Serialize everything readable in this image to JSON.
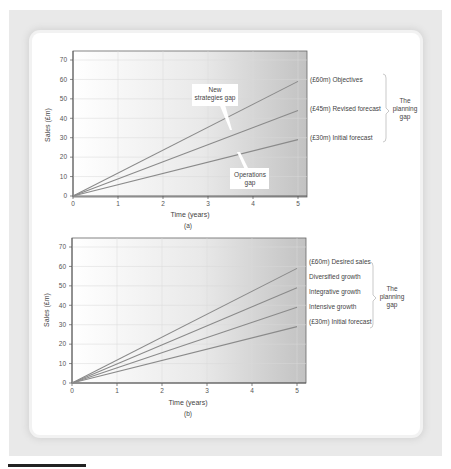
{
  "chart_data": [
    {
      "id": "a",
      "type": "line",
      "caption": "(a)",
      "xlabel": "Time (years)",
      "ylabel": "Sales (£m)",
      "xlim": [
        0,
        5
      ],
      "ylim": [
        0,
        70
      ],
      "xticks": [
        "0",
        "1",
        "2",
        "3",
        "4",
        "5"
      ],
      "yticks": [
        "0",
        "10",
        "20",
        "30",
        "40",
        "50",
        "60",
        "70"
      ],
      "grid": true,
      "series": [
        {
          "name": "(£60m) Objectives",
          "x": [
            0,
            5
          ],
          "y": [
            0,
            59
          ]
        },
        {
          "name": "(£45m) Revised forecast",
          "x": [
            0,
            5
          ],
          "y": [
            0,
            44
          ]
        },
        {
          "name": "(£30m) Initial forecast",
          "x": [
            0,
            5
          ],
          "y": [
            0,
            29
          ]
        }
      ],
      "annotations": [
        {
          "text": [
            "New",
            "strategies gap"
          ],
          "points_to": "between Objectives and Revised forecast"
        },
        {
          "text": [
            "Operations",
            "gap"
          ],
          "points_to": "between Revised forecast and Initial forecast"
        }
      ],
      "bracket_label": [
        "The",
        "planning",
        "gap"
      ]
    },
    {
      "id": "b",
      "type": "line",
      "caption": "(b)",
      "xlabel": "Time (years)",
      "ylabel": "Sales (£m)",
      "xlim": [
        0,
        5
      ],
      "ylim": [
        0,
        70
      ],
      "xticks": [
        "0",
        "1",
        "2",
        "3",
        "4",
        "5"
      ],
      "yticks": [
        "0",
        "10",
        "20",
        "30",
        "40",
        "50",
        "60",
        "70"
      ],
      "grid": true,
      "series": [
        {
          "name": "(£60m) Desired sales",
          "x": [
            0,
            5
          ],
          "y": [
            0,
            59
          ]
        },
        {
          "name": "Diversified growth",
          "x": [
            0,
            5
          ],
          "y": [
            0,
            49
          ]
        },
        {
          "name": "Integrative growth",
          "x": [
            0,
            5
          ],
          "y": [
            0,
            39
          ]
        },
        {
          "name": "Intensive growth",
          "x": [
            0,
            5
          ],
          "y": [
            0,
            29
          ]
        }
      ],
      "labels": [
        "(£60m) Desired sales",
        "Diversified growth",
        "Integrative growth",
        "Intensive growth",
        "(£30m) Initial forecast"
      ],
      "bracket_label": [
        "The",
        "planning",
        "gap"
      ]
    }
  ],
  "colors": {
    "line": "#8a8a8a",
    "axis": "#555555",
    "grid": "#d8d8d8",
    "plot_bg_left": "#ffffff",
    "plot_bg_right": "#c4c4c4"
  }
}
